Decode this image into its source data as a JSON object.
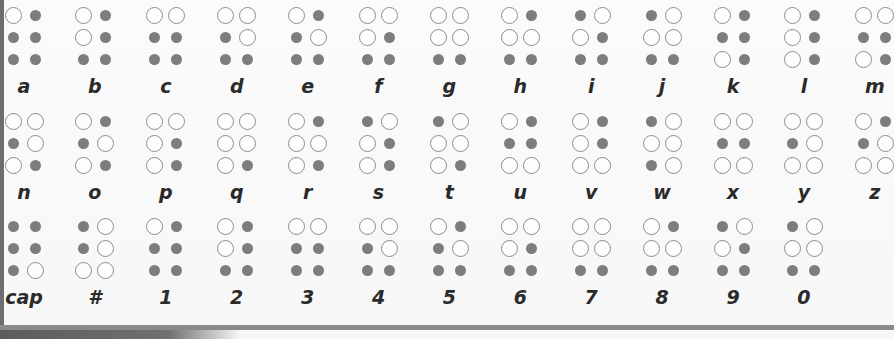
{
  "legend": {
    "raised_dot": "open circle",
    "flat_dot": "filled gray dot"
  },
  "dot_order": [
    "top-left",
    "top-right",
    "middle-left",
    "middle-right",
    "bottom-left",
    "bottom-right"
  ],
  "rows": [
    {
      "cells": [
        {
          "label": "a",
          "dots": [
            1,
            0,
            0,
            0,
            0,
            0
          ]
        },
        {
          "label": "b",
          "dots": [
            1,
            0,
            1,
            0,
            0,
            0
          ]
        },
        {
          "label": "c",
          "dots": [
            1,
            1,
            0,
            0,
            0,
            0
          ]
        },
        {
          "label": "d",
          "dots": [
            1,
            1,
            0,
            1,
            0,
            0
          ]
        },
        {
          "label": "e",
          "dots": [
            1,
            0,
            0,
            1,
            0,
            0
          ]
        },
        {
          "label": "f",
          "dots": [
            1,
            1,
            1,
            0,
            0,
            0
          ]
        },
        {
          "label": "g",
          "dots": [
            1,
            1,
            1,
            1,
            0,
            0
          ]
        },
        {
          "label": "h",
          "dots": [
            1,
            0,
            1,
            1,
            0,
            0
          ]
        },
        {
          "label": "i",
          "dots": [
            0,
            1,
            1,
            0,
            0,
            0
          ]
        },
        {
          "label": "j",
          "dots": [
            0,
            1,
            1,
            1,
            0,
            0
          ]
        },
        {
          "label": "k",
          "dots": [
            1,
            0,
            0,
            0,
            1,
            0
          ]
        },
        {
          "label": "l",
          "dots": [
            1,
            0,
            1,
            0,
            1,
            0
          ]
        },
        {
          "label": "m",
          "dots": [
            1,
            1,
            0,
            0,
            1,
            0
          ]
        }
      ]
    },
    {
      "cells": [
        {
          "label": "n",
          "dots": [
            1,
            1,
            0,
            1,
            1,
            0
          ]
        },
        {
          "label": "o",
          "dots": [
            1,
            0,
            0,
            1,
            1,
            0
          ]
        },
        {
          "label": "p",
          "dots": [
            1,
            1,
            1,
            0,
            1,
            0
          ]
        },
        {
          "label": "q",
          "dots": [
            1,
            1,
            1,
            1,
            1,
            0
          ]
        },
        {
          "label": "r",
          "dots": [
            1,
            0,
            1,
            1,
            1,
            0
          ]
        },
        {
          "label": "s",
          "dots": [
            0,
            1,
            1,
            0,
            1,
            0
          ]
        },
        {
          "label": "t",
          "dots": [
            0,
            1,
            1,
            1,
            1,
            0
          ]
        },
        {
          "label": "u",
          "dots": [
            1,
            0,
            0,
            0,
            1,
            1
          ]
        },
        {
          "label": "v",
          "dots": [
            1,
            0,
            1,
            0,
            1,
            1
          ]
        },
        {
          "label": "w",
          "dots": [
            0,
            1,
            1,
            1,
            0,
            1
          ]
        },
        {
          "label": "x",
          "dots": [
            1,
            1,
            0,
            0,
            1,
            1
          ]
        },
        {
          "label": "y",
          "dots": [
            1,
            1,
            0,
            1,
            1,
            1
          ]
        },
        {
          "label": "z",
          "dots": [
            1,
            0,
            0,
            1,
            1,
            1
          ]
        }
      ]
    },
    {
      "cells": [
        {
          "label": "cap",
          "dots": [
            0,
            0,
            0,
            0,
            0,
            1
          ]
        },
        {
          "label": "#",
          "dots": [
            0,
            1,
            0,
            1,
            1,
            1
          ]
        },
        {
          "label": "1",
          "dots": [
            1,
            0,
            0,
            0,
            0,
            0
          ]
        },
        {
          "label": "2",
          "dots": [
            1,
            0,
            1,
            0,
            0,
            0
          ]
        },
        {
          "label": "3",
          "dots": [
            1,
            1,
            0,
            0,
            0,
            0
          ]
        },
        {
          "label": "4",
          "dots": [
            1,
            1,
            0,
            1,
            0,
            0
          ]
        },
        {
          "label": "5",
          "dots": [
            1,
            0,
            0,
            1,
            0,
            0
          ]
        },
        {
          "label": "6",
          "dots": [
            1,
            1,
            1,
            0,
            0,
            0
          ]
        },
        {
          "label": "7",
          "dots": [
            1,
            1,
            1,
            1,
            0,
            0
          ]
        },
        {
          "label": "8",
          "dots": [
            1,
            0,
            1,
            1,
            0,
            0
          ]
        },
        {
          "label": "9",
          "dots": [
            0,
            1,
            1,
            0,
            0,
            0
          ]
        },
        {
          "label": "0",
          "dots": [
            0,
            1,
            1,
            1,
            0,
            0
          ]
        }
      ]
    }
  ],
  "colors": {
    "raised_border": "#8c8c8c",
    "flat_fill": "#7d7d7d",
    "label": "#2a2a2a",
    "frame": "#6e6e6e"
  }
}
